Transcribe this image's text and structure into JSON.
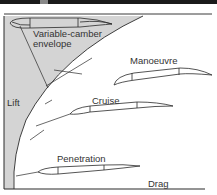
{
  "diagram": {
    "labels": {
      "envelope_line1": "Variable-camber",
      "envelope_line2": "envelope",
      "manoeuvre": "Manoeuvre",
      "cruise": "Cruise",
      "penetration": "Penetration",
      "lift_axis": "Lift",
      "drag_axis": "Drag"
    },
    "colors": {
      "envelope_fill": "#d4d4d4",
      "line": "#2a2a2a",
      "background": "#ffffff"
    }
  }
}
